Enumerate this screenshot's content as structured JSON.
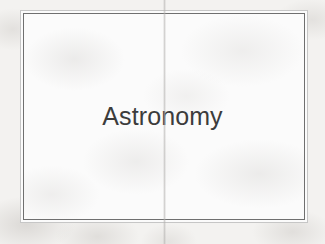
{
  "document": {
    "type": "scanned-presentation-slide",
    "title_text": "Astronomy"
  },
  "slide": {
    "title": "Astronomy"
  },
  "colors": {
    "page_background": "#f3f2f0",
    "slide_background": "#fbfbfb",
    "outer_border": "#c6c6c6",
    "inner_border": "#6f6f6f",
    "title_text": "#3c3c3c"
  }
}
